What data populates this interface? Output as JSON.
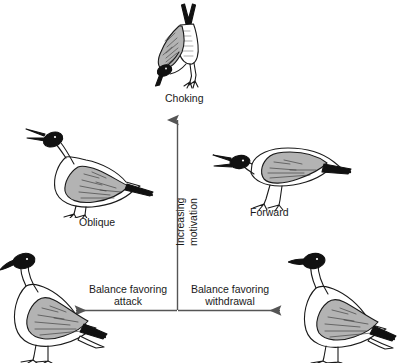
{
  "diagram": {
    "title_text": "",
    "background_color": "#ffffff",
    "ink_color": "#1a1a1a",
    "wing_gray": "#b3b3b3",
    "head_black": "#111111",
    "axes": {
      "vertical": {
        "label_left": "Increasing",
        "label_right": "motivation",
        "direction": "up",
        "meaning": "Increasing motivation"
      },
      "horizontal_left": {
        "label_line1": "Balance favoring",
        "label_line2": "attack",
        "direction": "left"
      },
      "horizontal_right": {
        "label_line1": "Balance favoring",
        "label_line2": "withdrawal",
        "direction": "right"
      }
    },
    "postures": [
      {
        "id": "choking",
        "label": "Choking",
        "position": "top-center"
      },
      {
        "id": "oblique",
        "label": "Oblique",
        "position": "middle-left"
      },
      {
        "id": "forward",
        "label": "Forward",
        "position": "middle-right"
      },
      {
        "id": "upright-left",
        "label": "",
        "position": "bottom-left"
      },
      {
        "id": "upright-right",
        "label": "",
        "position": "bottom-right"
      }
    ]
  }
}
